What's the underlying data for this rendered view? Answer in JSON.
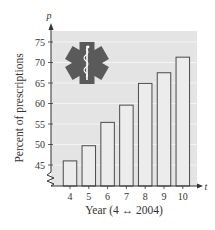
{
  "chart_data": {
    "type": "bar",
    "title": "",
    "xlabel": "Year (4 ↔ 2004)",
    "ylabel": "Percent of prescriptions",
    "x_axis_var": "t",
    "y_axis_var": "p",
    "categories": [
      "4",
      "5",
      "6",
      "7",
      "8",
      "9",
      "10"
    ],
    "x": [
      4,
      5,
      6,
      7,
      8,
      9,
      10
    ],
    "values": [
      46.0,
      49.7,
      55.4,
      59.6,
      64.9,
      67.5,
      71.3
    ],
    "ylim": [
      40,
      78
    ],
    "yticks": [
      45,
      50,
      55,
      60,
      65,
      70,
      75
    ],
    "grid": true,
    "y_axis_break": true,
    "legend": null,
    "annotations": [
      "star-of-life medical icon (decorative)"
    ]
  },
  "colors": {
    "plot_bg": "#e4e4e4",
    "grid": "#f4f4f4",
    "bar_fill": "#ececec",
    "bar_stroke": "#4a4a4a",
    "axis": "#333333",
    "icon": "#5a5a5a"
  }
}
